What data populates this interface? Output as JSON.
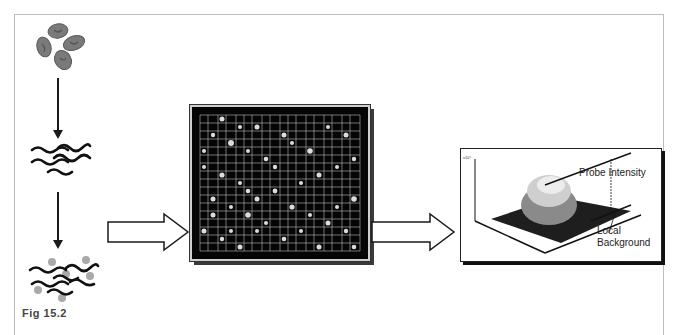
{
  "figure": {
    "caption": "Fig 15.2",
    "steps": [
      {
        "id": "cells",
        "description": "cluster of four cells"
      },
      {
        "id": "nucleic-acids",
        "description": "wavy nucleic acid strands"
      },
      {
        "id": "labeled-strands",
        "description": "strands with attached gray labels"
      },
      {
        "id": "microarray",
        "description": "microarray grid with bright spots"
      },
      {
        "id": "intensity-plot",
        "description": "3D surface plot of spot intensity"
      }
    ],
    "plot": {
      "label_probe_intensity": "Probe Intensity",
      "label_local": "Local",
      "label_background": "Background",
      "z_axis_ticks": [
        "1.5",
        "2",
        "2.5",
        "1",
        "0.5",
        "0"
      ],
      "z_axis_unit": "x10⁴",
      "x_axis_ticks": [
        "40",
        "30",
        "20",
        "10",
        "0"
      ],
      "y_axis_ticks": [
        "0",
        "10",
        "20",
        "30",
        "40"
      ]
    },
    "colors": {
      "frame_border": "#bdbdbd",
      "arrow_stroke": "#1a1a1a",
      "cell_fill": "#7a7a7a",
      "label_dot": "#a9a9a9",
      "microarray_bg": "#050505",
      "grid_line": "#bdbdbd"
    }
  }
}
